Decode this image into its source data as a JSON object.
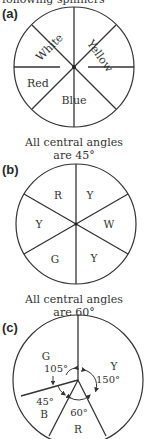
{
  "top_text": "following spinners",
  "figures": [
    {
      "id": "a",
      "label": "(a)",
      "sectors": [
        "White",
        "Yellow",
        "Red",
        "Blue"
      ],
      "caption_line1": "All central angles",
      "caption_line2": "are 45°"
    },
    {
      "id": "b",
      "label": "(b)",
      "sectors": [
        "R",
        "Y",
        "Y",
        "W",
        "G",
        "Y"
      ],
      "caption_line1": "All central angles",
      "caption_line2": "are 60°"
    },
    {
      "id": "c",
      "label": "(c)",
      "sectors": [
        {
          "letter": "G",
          "angle": "105°"
        },
        {
          "letter": "Y",
          "angle": "150°"
        },
        {
          "letter": "B",
          "angle": "45°"
        },
        {
          "letter": "R",
          "angle": "60°"
        }
      ]
    }
  ]
}
